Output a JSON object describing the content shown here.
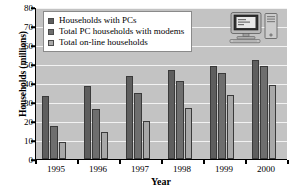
{
  "chart_data": {
    "type": "bar",
    "title": "",
    "xlabel": "Year",
    "ylabel": "Households (millions)",
    "categories": [
      "1995",
      "1996",
      "1997",
      "1998",
      "1999",
      "2000"
    ],
    "series": [
      {
        "name": "Households with PCs",
        "values": [
          33,
          38.5,
          43.5,
          47,
          49,
          52
        ],
        "color": "#5e5e5e"
      },
      {
        "name": "Total PC households with modems",
        "values": [
          17.5,
          26.5,
          35,
          41,
          45.5,
          49
        ],
        "color": "#6e6e6e"
      },
      {
        "name": "Total on-line households",
        "values": [
          9,
          14,
          20,
          27,
          33.5,
          39
        ],
        "color": "#a8a8a8"
      }
    ],
    "ylim": [
      0,
      80
    ],
    "ytick_step": 10,
    "yticks": [
      "0",
      "10",
      "20",
      "30",
      "40",
      "50",
      "60",
      "70",
      "80"
    ],
    "grid": true,
    "legend_position": "top-left",
    "plot_background": "#c3c3c3",
    "gridline_color": "#f2f2f2"
  },
  "legend": {
    "entries": [
      "Households with PCs",
      "Total PC households with modems",
      "Total on-line households"
    ]
  },
  "decoration": {
    "clipart_name": "desktop-computer-illustration"
  }
}
